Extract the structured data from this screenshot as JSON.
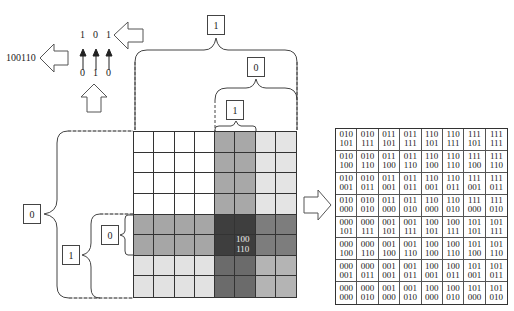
{
  "top_left": {
    "output_code": "100110",
    "upper_bits": [
      "1",
      "0",
      "1"
    ],
    "lower_bits": [
      "0",
      "1",
      "0"
    ]
  },
  "top_braces": [
    {
      "label": "1"
    },
    {
      "label": "0"
    },
    {
      "label": "1"
    }
  ],
  "left_braces": [
    {
      "label": "0"
    },
    {
      "label": "1"
    },
    {
      "label": "0"
    }
  ],
  "grid": {
    "rows": 8,
    "cols": 8,
    "center_label_line1": "100",
    "center_label_line2": "110",
    "shades": [
      [
        "#ffffff",
        "#ffffff",
        "#ffffff",
        "#ffffff",
        "#a8a8a8",
        "#a8a8a8",
        "#e4e4e4",
        "#e4e4e4"
      ],
      [
        "#ffffff",
        "#ffffff",
        "#ffffff",
        "#ffffff",
        "#a8a8a8",
        "#a8a8a8",
        "#e4e4e4",
        "#e4e4e4"
      ],
      [
        "#ffffff",
        "#ffffff",
        "#ffffff",
        "#ffffff",
        "#a8a8a8",
        "#a8a8a8",
        "#e4e4e4",
        "#e4e4e4"
      ],
      [
        "#ffffff",
        "#ffffff",
        "#ffffff",
        "#ffffff",
        "#a8a8a8",
        "#a8a8a8",
        "#e4e4e4",
        "#e4e4e4"
      ],
      [
        "#a6a6a6",
        "#a6a6a6",
        "#a6a6a6",
        "#a6a6a6",
        "#3e3e3e",
        "#3e3e3e",
        "#7d7d7d",
        "#7d7d7d"
      ],
      [
        "#a6a6a6",
        "#a6a6a6",
        "#a6a6a6",
        "#a6a6a6",
        "#3e3e3e",
        "#3e3e3e",
        "#7d7d7d",
        "#7d7d7d"
      ],
      [
        "#e2e2e2",
        "#e2e2e2",
        "#e2e2e2",
        "#e2e2e2",
        "#6b6b6b",
        "#6b6b6b",
        "#b4b4b4",
        "#b4b4b4"
      ],
      [
        "#e2e2e2",
        "#e2e2e2",
        "#e2e2e2",
        "#e2e2e2",
        "#6b6b6b",
        "#6b6b6b",
        "#b4b4b4",
        "#b4b4b4"
      ]
    ]
  },
  "code_table": [
    [
      [
        "010",
        "101"
      ],
      [
        "010",
        "111"
      ],
      [
        "011",
        "101"
      ],
      [
        "011",
        "111"
      ],
      [
        "110",
        "101"
      ],
      [
        "110",
        "111"
      ],
      [
        "111",
        "101"
      ],
      [
        "111",
        "111"
      ]
    ],
    [
      [
        "010",
        "100"
      ],
      [
        "010",
        "110"
      ],
      [
        "011",
        "100"
      ],
      [
        "011",
        "110"
      ],
      [
        "110",
        "100"
      ],
      [
        "110",
        "110"
      ],
      [
        "111",
        "100"
      ],
      [
        "111",
        "110"
      ]
    ],
    [
      [
        "010",
        "001"
      ],
      [
        "010",
        "011"
      ],
      [
        "011",
        "001"
      ],
      [
        "011",
        "011"
      ],
      [
        "110",
        "001"
      ],
      [
        "110",
        "011"
      ],
      [
        "111",
        "001"
      ],
      [
        "111",
        "011"
      ]
    ],
    [
      [
        "010",
        "000"
      ],
      [
        "010",
        "010"
      ],
      [
        "011",
        "000"
      ],
      [
        "011",
        "010"
      ],
      [
        "110",
        "000"
      ],
      [
        "110",
        "010"
      ],
      [
        "111",
        "000"
      ],
      [
        "111",
        "010"
      ]
    ],
    [
      [
        "000",
        "101"
      ],
      [
        "000",
        "111"
      ],
      [
        "001",
        "101"
      ],
      [
        "001",
        "111"
      ],
      [
        "100",
        "101"
      ],
      [
        "100",
        "111"
      ],
      [
        "101",
        "101"
      ],
      [
        "101",
        "111"
      ]
    ],
    [
      [
        "000",
        "100"
      ],
      [
        "000",
        "110"
      ],
      [
        "001",
        "100"
      ],
      [
        "001",
        "110"
      ],
      [
        "100",
        "100"
      ],
      [
        "100",
        "110"
      ],
      [
        "101",
        "100"
      ],
      [
        "101",
        "110"
      ]
    ],
    [
      [
        "000",
        "001"
      ],
      [
        "000",
        "011"
      ],
      [
        "001",
        "001"
      ],
      [
        "001",
        "011"
      ],
      [
        "100",
        "001"
      ],
      [
        "100",
        "011"
      ],
      [
        "101",
        "001"
      ],
      [
        "101",
        "011"
      ]
    ],
    [
      [
        "000",
        "000"
      ],
      [
        "000",
        "010"
      ],
      [
        "001",
        "000"
      ],
      [
        "001",
        "010"
      ],
      [
        "100",
        "000"
      ],
      [
        "100",
        "010"
      ],
      [
        "101",
        "000"
      ],
      [
        "101",
        "010"
      ]
    ]
  ]
}
